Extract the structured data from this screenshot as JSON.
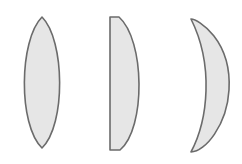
{
  "diagram": {
    "title": "",
    "colors": {
      "background": "#ffffff",
      "lens_fill": "#e6e6e6",
      "lens_stroke": "#6b6b6b"
    },
    "lenses": [
      {
        "type": "biconvex",
        "label": ""
      },
      {
        "type": "plano-convex",
        "label": ""
      },
      {
        "type": "positive-meniscus",
        "label": ""
      }
    ]
  }
}
